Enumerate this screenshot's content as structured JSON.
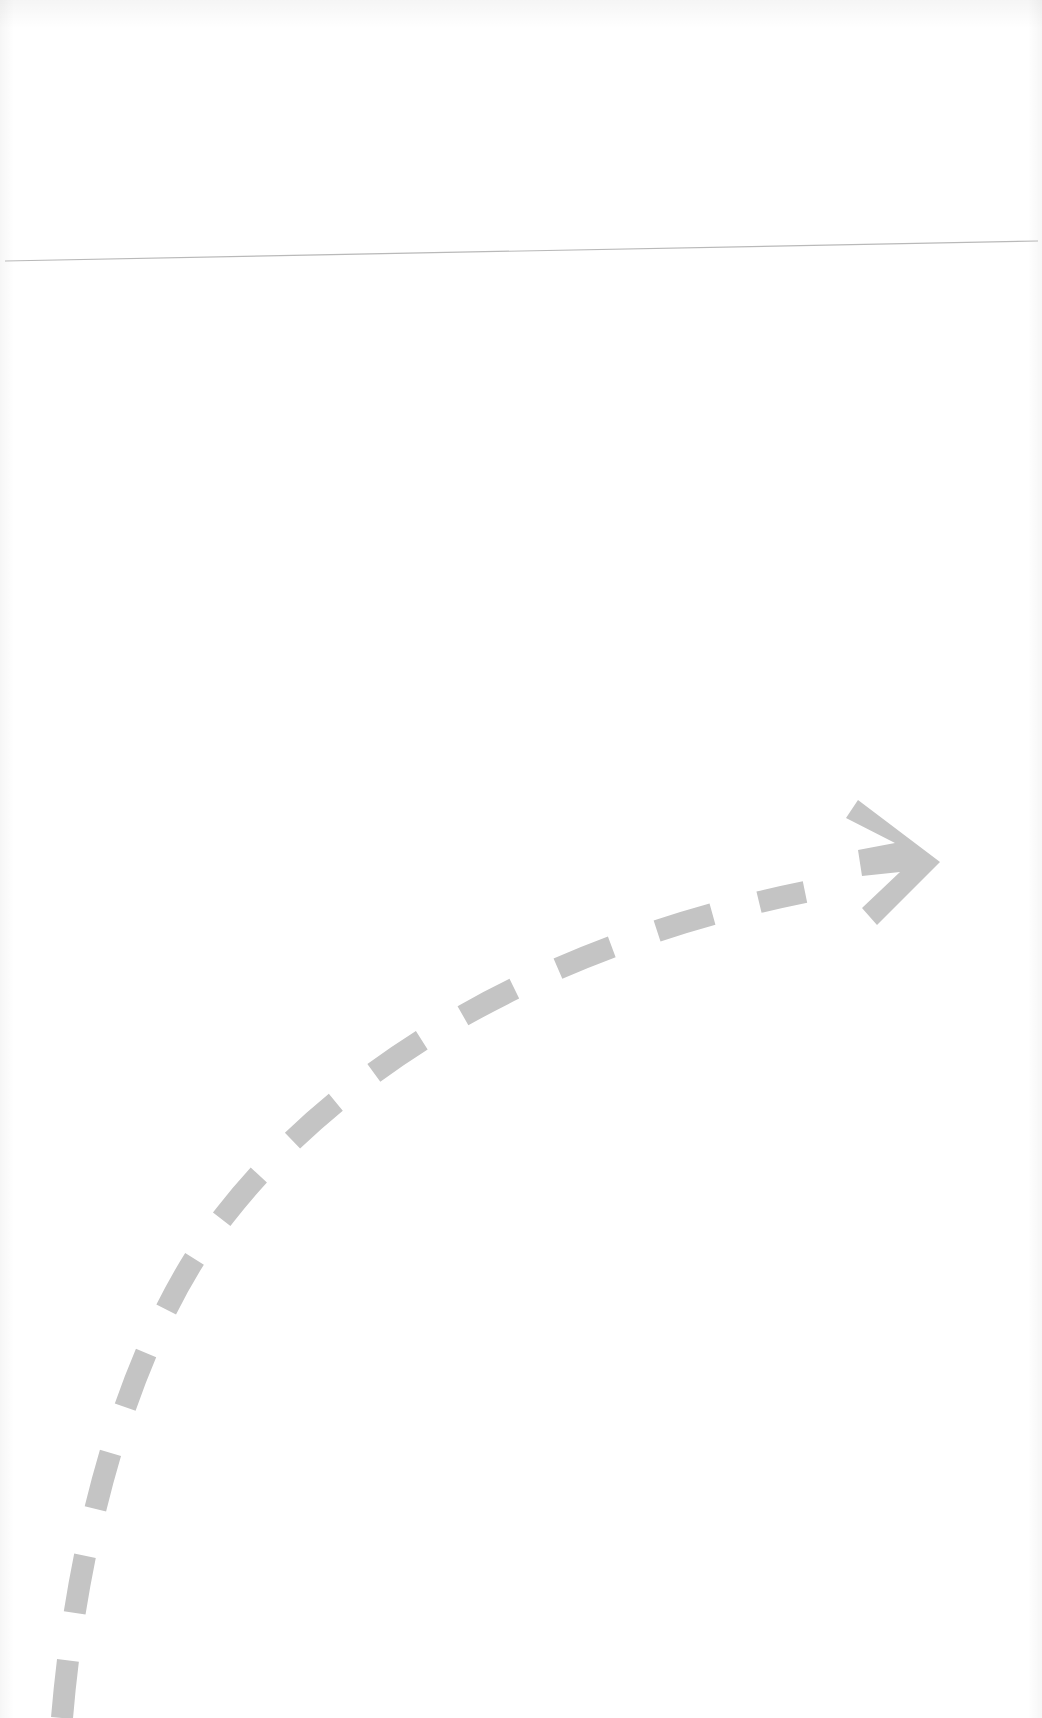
{
  "page": {
    "background_color": "#ffffff"
  },
  "rule": {
    "color": "#b9b9b9",
    "from": [
      5,
      261
    ],
    "to": [
      1038,
      241
    ]
  },
  "arrow": {
    "icon": "dashed-curved-arrow-icon",
    "color": "#c4c4c4",
    "style": "dashed",
    "direction": "up-right",
    "head": "chevron"
  }
}
